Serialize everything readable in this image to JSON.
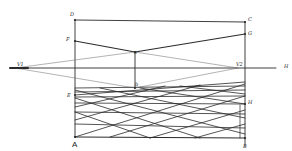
{
  "diagram": {
    "colors": {
      "line": "#2a2a2a",
      "thin_line": "#555555",
      "background": "#ffffff"
    },
    "labels": {
      "D": "D",
      "C": "C",
      "F": "F",
      "G": "G",
      "a": "a",
      "b": "b",
      "E": "E",
      "H_right": "H",
      "A": "A",
      "B": "B",
      "VP_left": "V1",
      "VP_right": "V2",
      "horizon": "H"
    }
  }
}
